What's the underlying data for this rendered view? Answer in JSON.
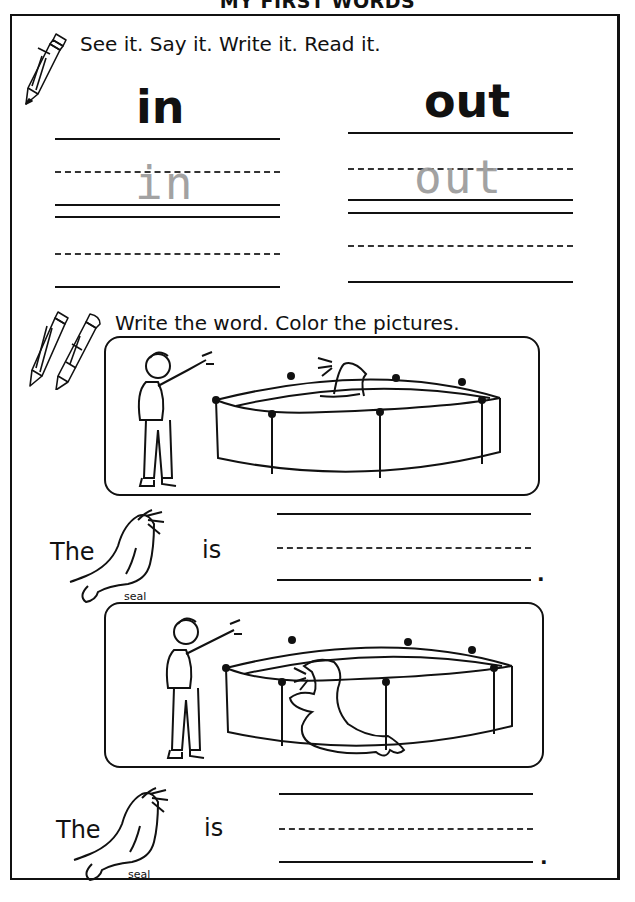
{
  "page": {
    "title": "MY FIRST WORDS"
  },
  "section1": {
    "instruction": "See it. Say it. Write it. Read it.",
    "words": [
      {
        "word": "in",
        "trace": "in"
      },
      {
        "word": "out",
        "trace": "out"
      }
    ]
  },
  "section2": {
    "instruction": "Write the word. Color the pictures.",
    "pictures": [
      {
        "description": "boy pointing at seal in pool",
        "seal_position": "in"
      },
      {
        "description": "boy pointing at seal outside pool",
        "seal_position": "out"
      }
    ],
    "sentences": [
      {
        "prefix": "The",
        "picture_label": "seal",
        "verb": "is",
        "end": "."
      },
      {
        "prefix": "The",
        "picture_label": "seal",
        "verb": "is",
        "end": "."
      }
    ]
  },
  "colors": {
    "ink": "#111111",
    "trace": "#999999",
    "paper": "#ffffff"
  }
}
